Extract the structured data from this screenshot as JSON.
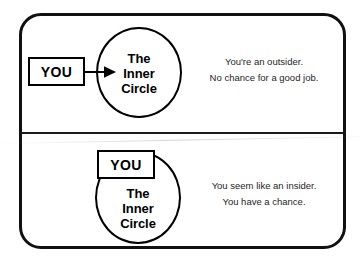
{
  "diagram": {
    "title": "The Inner Circle",
    "frame": {
      "shape": "rounded-rectangle",
      "stroke_color": "#111111",
      "fill_color": "#ffffff"
    },
    "panels": [
      {
        "id": "outsider",
        "you_label": "YOU",
        "circle_label_lines": [
          "The",
          "Inner",
          "Circle"
        ],
        "has_arrow": true,
        "arrow_direction": "right",
        "caption_lines": [
          "You're an outsider.",
          "No chance for a good job."
        ]
      },
      {
        "id": "insider",
        "you_label": "YOU",
        "circle_label_lines": [
          "The",
          "Inner",
          "Circle"
        ],
        "has_arrow": false,
        "arrow_direction": "",
        "caption_lines": [
          "You seem like an insider.",
          "You have a chance."
        ]
      }
    ]
  }
}
